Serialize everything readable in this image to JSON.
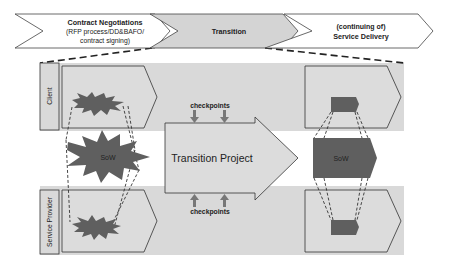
{
  "phases": [
    {
      "title": "Contract Negotiations",
      "subtitle_line1": "(RFP process/DD&BAFO/",
      "subtitle_line2": "contract signing)"
    },
    {
      "title": "Transition"
    },
    {
      "title_line1": "(continuing of)",
      "title_line2": "Service Delivery"
    }
  ],
  "lanes": {
    "client": "Client",
    "service_provider": "Service Provider"
  },
  "center": {
    "project_label": "Transition Project",
    "checkpoints_top": "checkpoints",
    "checkpoints_bottom": "checkpoints"
  },
  "sow": {
    "left_label": "SoW",
    "right_label": "SoW"
  },
  "colors": {
    "band": "#d9d9d9",
    "shape_fill": "#dcdcdc",
    "chevron_gray": "#d4d4d4",
    "sow_dark": "#5f5f5f",
    "stroke": "#333333"
  }
}
